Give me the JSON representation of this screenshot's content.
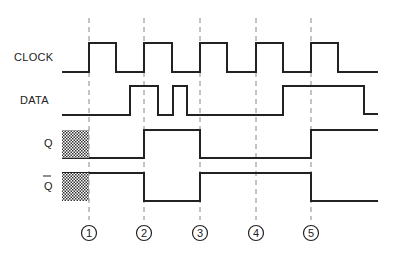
{
  "diagram": {
    "type": "timing-diagram",
    "signals": [
      {
        "name": "CLOCK",
        "label_y": 57
      },
      {
        "name": "DATA",
        "label_y": 100
      },
      {
        "name": "Q",
        "label_y": 143
      },
      {
        "name": "Q̄",
        "label_y": 186
      }
    ],
    "markers": [
      "1",
      "2",
      "3",
      "4",
      "5"
    ],
    "colors": {
      "line": "#222222",
      "dash": "#888888",
      "hatch": "#555555"
    }
  }
}
